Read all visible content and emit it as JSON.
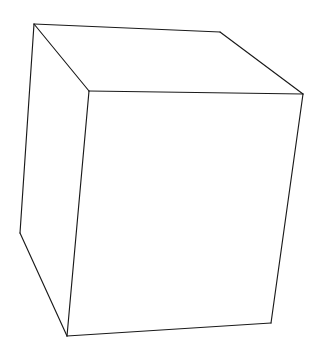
{
  "image": {
    "title": "Wireframe cube line drawing",
    "subject": "cube",
    "style": "hand-drawn wireframe sketch",
    "background_color": "#ffffff",
    "stroke_color": "#1a1a1a",
    "stroke_width": 1.15,
    "width": 320,
    "height": 356,
    "text_content": "",
    "vertices": {
      "back_top_left": [
        34,
        24
      ],
      "back_top_right": [
        220,
        32
      ],
      "front_top_left": [
        89,
        91
      ],
      "front_top_right": [
        303,
        94
      ],
      "back_bottom_left": [
        20,
        233
      ],
      "front_bottom_left": [
        67,
        336
      ],
      "front_bottom_right": [
        271,
        323
      ]
    },
    "faces": {
      "top": "34,24 220,32 303,94 89,91",
      "left": "34,24 89,91 67,336 20,233",
      "front": "89,91 303,94 271,323 67,336"
    },
    "edges": [
      {
        "name": "top-back-edge",
        "path": "M 34 24 L 220 32"
      },
      {
        "name": "top-right-receding-edge",
        "path": "M 220 32 L 303 94"
      },
      {
        "name": "top-front-edge",
        "path": "M 89 91 L 303 94"
      },
      {
        "name": "top-left-receding-edge",
        "path": "M 34 24 L 89 91"
      },
      {
        "name": "left-back-vertical-edge",
        "path": "M 34 24 L 20 233"
      },
      {
        "name": "left-bottom-receding-edge",
        "path": "M 20 233 L 67 336"
      },
      {
        "name": "front-left-vertical-edge",
        "path": "M 89 91 L 67 336"
      },
      {
        "name": "front-right-vertical-edge",
        "path": "M 303 94 L 271 323"
      },
      {
        "name": "front-bottom-edge",
        "path": "M 67 336 L 271 323"
      }
    ]
  }
}
